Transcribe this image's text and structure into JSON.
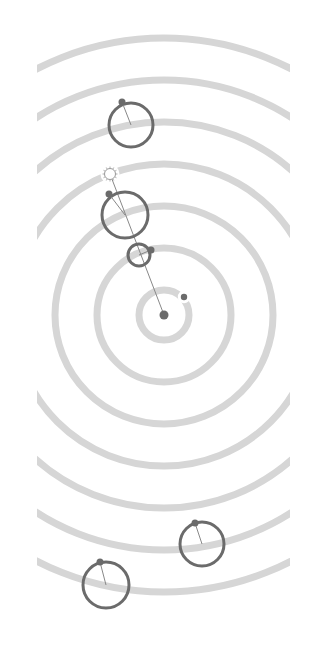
{
  "diagram": {
    "title": "",
    "width": 315,
    "height": 645,
    "colors": {
      "background": "#ffffff",
      "ring": "#d6d6d6",
      "body": "#6b6b6b",
      "hand": "#888888",
      "sun_stroke": "#9a9a9a",
      "sun_fill": "#ffffff"
    },
    "center": {
      "x": 164,
      "y": 315,
      "r": 4.5
    },
    "clip": {
      "x_min": 37,
      "x_max": 290
    },
    "rings": [
      25,
      67,
      109,
      151,
      193,
      235,
      277
    ],
    "alignment_line": {
      "x1": 110,
      "y1": 174,
      "x2": 164,
      "y2": 315
    },
    "sun": {
      "x": 110,
      "y": 174,
      "r": 5.5,
      "ring_index": 3
    },
    "inner_body": {
      "x": 184,
      "y": 297,
      "r": 3.2,
      "ring_index": 0
    },
    "epicycles": [
      {
        "name": "epicycle-ring-1",
        "cx": 139,
        "cy": 255,
        "r": 11,
        "dot_x": 151,
        "dot_y": 250,
        "dot_r": 3.5
      },
      {
        "name": "epicycle-ring-2",
        "cx": 125,
        "cy": 215,
        "r": 23,
        "dot_x": 109,
        "dot_y": 194,
        "dot_r": 3.5
      },
      {
        "name": "epicycle-ring-4",
        "cx": 131,
        "cy": 125,
        "r": 22,
        "dot_x": 122,
        "dot_y": 102,
        "dot_r": 3.5
      },
      {
        "name": "epicycle-ring-5",
        "cx": 202,
        "cy": 544,
        "r": 22,
        "dot_x": 195,
        "dot_y": 523,
        "dot_r": 3.5
      },
      {
        "name": "epicycle-ring-6",
        "cx": 106,
        "cy": 585,
        "r": 23,
        "dot_x": 100,
        "dot_y": 562,
        "dot_r": 3.5
      }
    ]
  }
}
